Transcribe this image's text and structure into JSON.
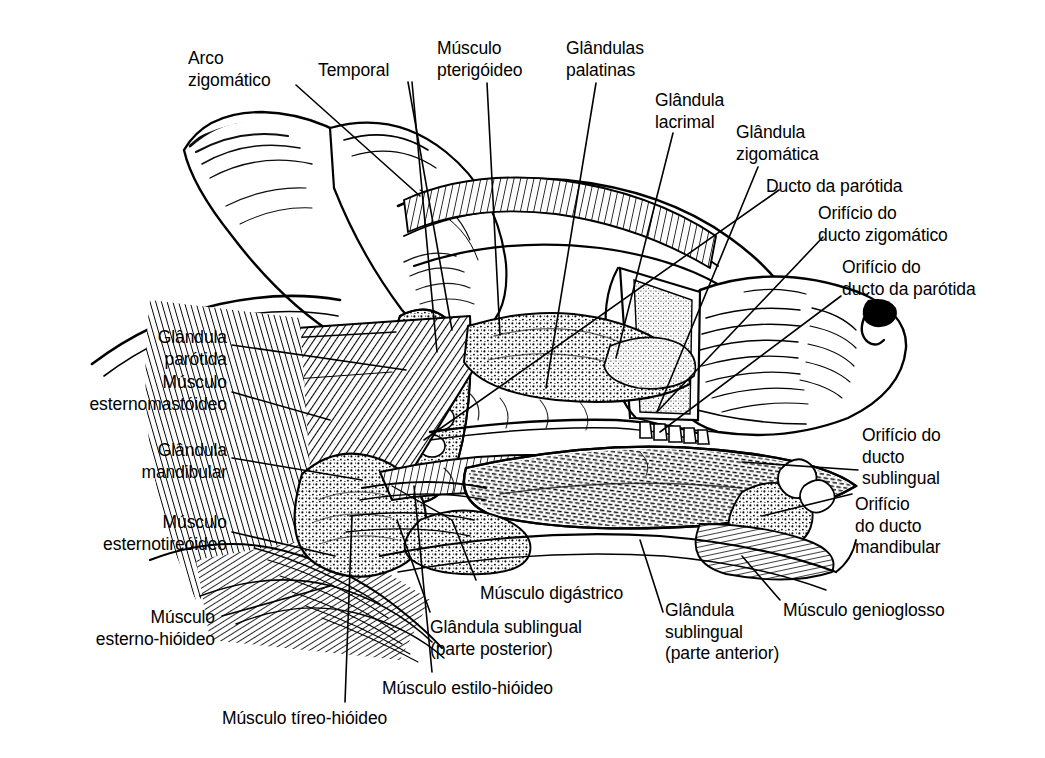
{
  "figure": {
    "style": "pen-and-ink line drawing",
    "background_color": "#ffffff",
    "ink_color": "#000000",
    "canvas": {
      "width": 1045,
      "height": 758
    }
  },
  "labels": [
    {
      "id": "arco-zigomatico",
      "text": "Arco\nzigomático",
      "x": 188,
      "y": 48,
      "align": "left"
    },
    {
      "id": "temporal",
      "text": "Temporal",
      "x": 318,
      "y": 60,
      "align": "left"
    },
    {
      "id": "musculo-pterigoideo",
      "text": "Músculo\npterigóideo",
      "x": 437,
      "y": 38,
      "align": "left"
    },
    {
      "id": "glandulas-palatinas",
      "text": "Glândulas\npalatinas",
      "x": 566,
      "y": 38,
      "align": "left"
    },
    {
      "id": "glandula-lacrimal",
      "text": "Glândula\nlacrimal",
      "x": 655,
      "y": 90,
      "align": "left"
    },
    {
      "id": "glandula-zigomatica",
      "text": "Glândula\nzigomática",
      "x": 736,
      "y": 122,
      "align": "left"
    },
    {
      "id": "ducto-da-parotida",
      "text": "Ducto da parótida",
      "x": 766,
      "y": 176,
      "align": "left"
    },
    {
      "id": "orificio-ducto-zigomatico",
      "text": "Orifício do\nducto zigomático",
      "x": 818,
      "y": 203,
      "align": "left"
    },
    {
      "id": "orificio-ducto-parotida",
      "text": "Orifício do\nducto da parótida",
      "x": 842,
      "y": 257,
      "align": "left"
    },
    {
      "id": "glandula-parotida",
      "text": "Glândula\nparótida",
      "x": 227,
      "y": 327,
      "align": "right"
    },
    {
      "id": "musculo-esternomastoideo",
      "text": "Músculo\nesternomastóideo",
      "x": 227,
      "y": 372,
      "align": "right"
    },
    {
      "id": "glandula-mandibular",
      "text": "Glândula\nmandibular",
      "x": 227,
      "y": 440,
      "align": "right"
    },
    {
      "id": "musculo-esternotireoideo",
      "text": "Músculo\nesternotireóideo",
      "x": 227,
      "y": 512,
      "align": "right"
    },
    {
      "id": "musculo-esterno-hioideo",
      "text": "Músculo\nesterno-hióideo",
      "x": 215,
      "y": 607,
      "align": "right"
    },
    {
      "id": "orificio-ducto-sublingual",
      "text": "Orifício do\nducto\nsublingual",
      "x": 862,
      "y": 425,
      "align": "left"
    },
    {
      "id": "orificio-ducto-mandibular",
      "text": "Orifício\ndo ducto\nmandibular",
      "x": 855,
      "y": 494,
      "align": "left"
    },
    {
      "id": "musculo-digastrico",
      "text": "Músculo digástrico",
      "x": 480,
      "y": 583,
      "align": "left"
    },
    {
      "id": "glandula-sublingual-post",
      "text": "Glândula sublingual\n(parte posterior)",
      "x": 430,
      "y": 617,
      "align": "left"
    },
    {
      "id": "glandula-sublingual-ant",
      "text": "Glândula\nsublingual\n(parte anterior)",
      "x": 665,
      "y": 600,
      "align": "left"
    },
    {
      "id": "musculo-genioglosso",
      "text": "Músculo genioglosso",
      "x": 783,
      "y": 600,
      "align": "left"
    },
    {
      "id": "musculo-estilo-hioideo",
      "text": "Músculo estilo-hióideo",
      "x": 382,
      "y": 678,
      "align": "left"
    },
    {
      "id": "musculo-tireo-hioideo",
      "text": "Músculo tíreo-hióideo",
      "x": 222,
      "y": 708,
      "align": "left"
    }
  ],
  "leaders": [
    {
      "id": "lead-arco-zigomatico",
      "points": "296,85 420,196"
    },
    {
      "id": "lead-temporal",
      "points": "408,82 452,330"
    },
    {
      "id": "lead-temporal-2",
      "points": "412,82 437,352"
    },
    {
      "id": "lead-musculo-pterigoideo",
      "points": "487,83 500,335"
    },
    {
      "id": "lead-glandulas-palatinas",
      "points": "596,83 546,388"
    },
    {
      "id": "lead-glandula-lacrimal",
      "points": "673,133 616,358"
    },
    {
      "id": "lead-glandula-zigomatica",
      "points": "758,167 657,412"
    },
    {
      "id": "lead-ducto-da-parotida",
      "points": "779,190 424,440"
    },
    {
      "id": "lead-orificio-ducto-zigomatico",
      "points": "823,237 657,412"
    },
    {
      "id": "lead-orificio-ducto-parotida",
      "points": "841,296 660,432"
    },
    {
      "id": "lead-glandula-parotida",
      "points": "232,345 406,370"
    },
    {
      "id": "lead-musculo-esternomastoideo",
      "points": "232,392 330,420"
    },
    {
      "id": "lead-glandula-mandibular",
      "points": "232,458 362,480"
    },
    {
      "id": "lead-musculo-esternotireoideo",
      "points": "232,532 335,556"
    },
    {
      "id": "lead-musculo-esterno-hioideo",
      "points": "222,616 330,586"
    },
    {
      "id": "lead-orificio-ducto-sublingual",
      "points": "858,470 742,462"
    },
    {
      "id": "lead-orificio-ducto-mandibular",
      "points": "852,494 762,516"
    },
    {
      "id": "lead-musculo-digastrico",
      "points": "476,580 452,520"
    },
    {
      "id": "lead-glandula-sublingual-post",
      "points": "430,612 397,520"
    },
    {
      "id": "lead-glandula-sublingual-ant",
      "points": "663,612 640,540"
    },
    {
      "id": "lead-musculo-genioglosso",
      "points": "780,600 742,556"
    },
    {
      "id": "lead-musculo-estilo-hioideo",
      "points": "432,672 414,486"
    },
    {
      "id": "lead-musculo-tireo-hioideo",
      "points": "345,702 352,516"
    }
  ],
  "anatomy_parts": [
    {
      "id": "ear-pinna",
      "name": "orelha (pavilhão auricular)"
    },
    {
      "id": "skull-dome",
      "name": "crânio / região temporal"
    },
    {
      "id": "muzzle",
      "name": "focinho"
    },
    {
      "id": "nose",
      "name": "nariz"
    },
    {
      "id": "tongue",
      "name": "língua"
    },
    {
      "id": "teeth-row",
      "name": "arcada dentária"
    },
    {
      "id": "parotid-gland",
      "name": "glândula parótida"
    },
    {
      "id": "mandibular-gland",
      "name": "glândula mandibular"
    },
    {
      "id": "sublingual-gland",
      "name": "glândula sublingual"
    },
    {
      "id": "neck-muscles",
      "name": "musculatura cervical"
    }
  ]
}
